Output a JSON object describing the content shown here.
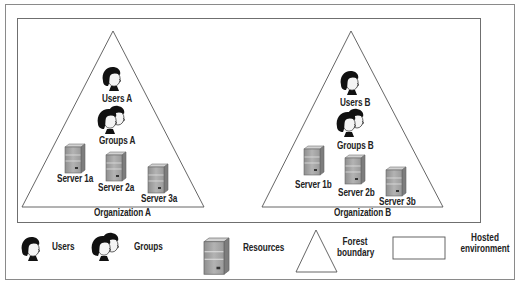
{
  "diagram": {
    "type": "hosted-environment-forests",
    "hosted_environment": {
      "organizations": [
        {
          "name": "Organization A",
          "users_label": "Users A",
          "groups_label": "Groups A",
          "servers": [
            "Server 1a",
            "Server 2a",
            "Server 3a"
          ]
        },
        {
          "name": "Organization B",
          "users_label": "Users B",
          "groups_label": "Groups B",
          "servers": [
            "Server 1b",
            "Server 2b",
            "Server 3b"
          ]
        }
      ]
    },
    "legend": {
      "users": "Users",
      "groups": "Groups",
      "resources": "Resources",
      "forest_line1": "Forest",
      "forest_line2": "boundary",
      "hosted_line1": "Hosted",
      "hosted_line2": "environment"
    },
    "icons": {
      "user": "user-head-icon",
      "group": "group-heads-icon",
      "server": "server-tower-icon",
      "forest": "triangle-outline",
      "hosted": "rectangle-outline"
    },
    "colors": {
      "line": "#555555",
      "server_body": "#a9a9a9",
      "server_top": "#d0d0d0",
      "hair": "#111111",
      "face": "#f4f4f4"
    }
  }
}
